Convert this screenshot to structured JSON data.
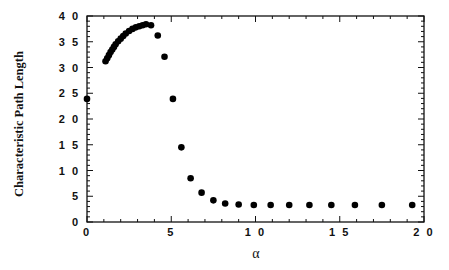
{
  "chart_data": {
    "type": "scatter",
    "title": "",
    "xlabel": "α",
    "ylabel": "Characteristic Path Length",
    "xlim": [
      0,
      20
    ],
    "ylim": [
      0,
      40
    ],
    "x_ticks": [
      0,
      5,
      10,
      15,
      20
    ],
    "x_tick_labels": [
      "0",
      "5",
      "1 0",
      "1 5",
      "2 0"
    ],
    "y_ticks": [
      0,
      5,
      10,
      15,
      20,
      25,
      30,
      35,
      40
    ],
    "y_tick_labels": [
      "0",
      "5",
      "1 0",
      "1 5",
      "2 0",
      "2 5",
      "3 0",
      "3 5",
      "4 0"
    ],
    "x_minor_step": 1,
    "y_minor_step": 1,
    "grid": false,
    "legend": null,
    "marker_color": "#000000",
    "series": [
      {
        "name": "Characteristic Path Length",
        "x": [
          0.0,
          1.1,
          1.2,
          1.3,
          1.4,
          1.5,
          1.6,
          1.7,
          1.85,
          2.0,
          2.15,
          2.3,
          2.5,
          2.7,
          2.9,
          3.1,
          3.3,
          3.5,
          3.8,
          4.2,
          4.6,
          5.1,
          5.6,
          6.15,
          6.8,
          7.5,
          8.2,
          9.0,
          9.9,
          10.9,
          12.0,
          13.2,
          14.5,
          15.9,
          17.5,
          19.3
        ],
        "y": [
          23.9,
          31.2,
          31.8,
          32.4,
          33.0,
          33.5,
          34.0,
          34.5,
          35.1,
          35.6,
          36.1,
          36.6,
          37.1,
          37.5,
          37.8,
          38.0,
          38.2,
          38.4,
          38.2,
          36.2,
          32.1,
          23.9,
          14.5,
          8.5,
          5.7,
          4.2,
          3.6,
          3.4,
          3.3,
          3.3,
          3.3,
          3.3,
          3.3,
          3.3,
          3.3,
          3.3
        ]
      }
    ]
  }
}
